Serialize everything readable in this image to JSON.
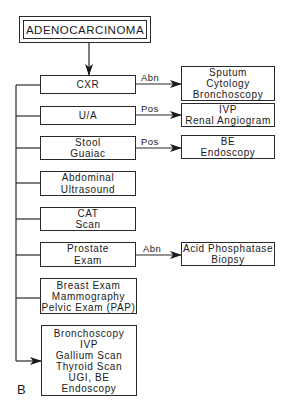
{
  "diagram": {
    "title": "ADENOCARCINOMA",
    "panel_label": "B",
    "tests": [
      {
        "id": "cxr",
        "lines": [
          "CXR"
        ],
        "edge_label": "Abn",
        "followup": [
          "Sputum",
          "Cytology",
          "Bronchoscopy"
        ]
      },
      {
        "id": "ua",
        "lines": [
          "U/A"
        ],
        "edge_label": "Pos",
        "followup": [
          "IVP",
          "Renal Angiogram"
        ]
      },
      {
        "id": "stool",
        "lines": [
          "Stool",
          "Guaiac"
        ],
        "edge_label": "Pos",
        "followup": [
          "BE",
          "Endoscopy"
        ]
      },
      {
        "id": "abdominal",
        "lines": [
          "Abdominal",
          "Ultrasound"
        ]
      },
      {
        "id": "cat",
        "lines": [
          "CAT",
          "Scan"
        ]
      },
      {
        "id": "prostate",
        "lines": [
          "Prostate",
          "Exam"
        ],
        "edge_label": "Abn",
        "followup": [
          "Acid Phosphatase",
          "Biopsy"
        ]
      },
      {
        "id": "breast",
        "lines": [
          "Breast Exam",
          "Mammography",
          "Pelvic Exam (PAP)"
        ]
      },
      {
        "id": "final",
        "lines": [
          "Bronchoscopy",
          "IVP",
          "Gallium Scan",
          "Thyroid Scan",
          "UGI, BE",
          "Endoscopy"
        ]
      }
    ]
  }
}
